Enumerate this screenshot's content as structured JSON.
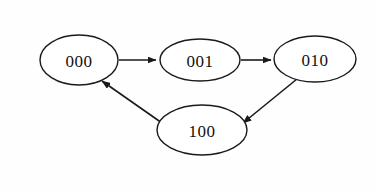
{
  "diagram": {
    "background_color": "#fefefe",
    "stroke_color": "#1a1a1a",
    "node_fill_color": "#ffffff",
    "label_color": "#111111",
    "nodes": [
      {
        "id": "n000",
        "label": "000",
        "cx": 79,
        "cy": 60,
        "rx": 39,
        "ry": 25
      },
      {
        "id": "n001",
        "label": "001",
        "cx": 200,
        "cy": 60,
        "rx": 40,
        "ry": 21
      },
      {
        "id": "n010",
        "label": "010",
        "cx": 315,
        "cy": 59,
        "rx": 41,
        "ry": 23
      },
      {
        "id": "n100",
        "label": "100",
        "cx": 202,
        "cy": 130,
        "rx": 45,
        "ry": 25
      }
    ],
    "edges": [
      {
        "id": "e1",
        "from": "000",
        "to": "001",
        "arrow": "right"
      },
      {
        "id": "e2",
        "from": "001",
        "to": "010",
        "arrow": "right"
      },
      {
        "id": "e3",
        "from": "010",
        "to": "100",
        "arrow": "down-left"
      },
      {
        "id": "e4",
        "from": "100",
        "to": "000",
        "arrow": "up-left"
      }
    ]
  }
}
